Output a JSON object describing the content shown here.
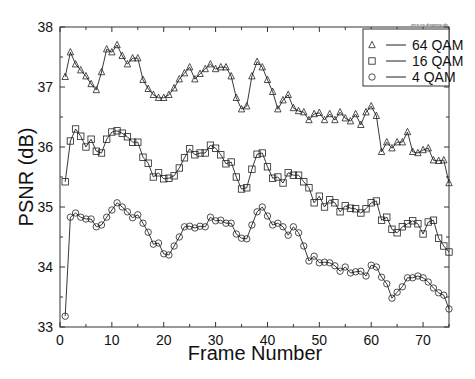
{
  "chart_data": {
    "type": "line",
    "title": "",
    "file_label": "zero-no-dropping.gle",
    "xlabel": "Frame Number",
    "ylabel": "PSNR (dB)",
    "xlim": [
      0,
      75
    ],
    "ylim": [
      33,
      38
    ],
    "xticks": [
      0,
      10,
      20,
      30,
      40,
      50,
      60,
      70
    ],
    "yticks": [
      33,
      34,
      35,
      36,
      37,
      38
    ],
    "grid": false,
    "legend_position": "top-right",
    "x": [
      1,
      2,
      3,
      4,
      5,
      6,
      7,
      8,
      9,
      10,
      11,
      12,
      13,
      14,
      15,
      16,
      17,
      18,
      19,
      20,
      21,
      22,
      23,
      24,
      25,
      26,
      27,
      28,
      29,
      30,
      31,
      32,
      33,
      34,
      35,
      36,
      37,
      38,
      39,
      40,
      41,
      42,
      43,
      44,
      45,
      46,
      47,
      48,
      49,
      50,
      51,
      52,
      53,
      54,
      55,
      56,
      57,
      58,
      59,
      60,
      61,
      62,
      63,
      64,
      65,
      66,
      67,
      68,
      69,
      70,
      71,
      72,
      73,
      74,
      75
    ],
    "series": [
      {
        "name": "64 QAM",
        "marker": "triangle",
        "values": [
          37.17,
          37.58,
          37.38,
          37.28,
          37.18,
          37.05,
          36.95,
          37.25,
          37.63,
          37.58,
          37.7,
          37.52,
          37.38,
          37.48,
          37.48,
          37.12,
          36.97,
          36.87,
          36.82,
          36.82,
          36.87,
          36.98,
          37.13,
          37.23,
          37.33,
          37.13,
          37.22,
          37.3,
          37.38,
          37.3,
          37.33,
          37.33,
          37.18,
          36.82,
          36.63,
          36.68,
          37.18,
          37.42,
          37.33,
          37.12,
          36.92,
          36.63,
          36.78,
          36.87,
          36.65,
          36.6,
          36.58,
          36.45,
          36.55,
          36.57,
          36.45,
          36.55,
          36.45,
          36.58,
          36.48,
          36.43,
          36.55,
          36.37,
          36.58,
          36.68,
          36.52,
          35.92,
          36.08,
          35.98,
          36.08,
          36.08,
          36.25,
          35.92,
          35.9,
          35.95,
          35.98,
          35.78,
          35.77,
          35.78,
          35.4
        ]
      },
      {
        "name": "16 QAM",
        "marker": "square",
        "values": [
          35.42,
          36.1,
          36.3,
          36.18,
          36.0,
          36.13,
          35.93,
          35.9,
          36.13,
          36.25,
          36.27,
          36.23,
          36.17,
          36.08,
          36.08,
          35.83,
          35.73,
          35.5,
          35.57,
          35.47,
          35.48,
          35.52,
          35.65,
          35.82,
          35.97,
          35.87,
          35.9,
          35.9,
          36.03,
          35.98,
          35.87,
          35.72,
          35.75,
          35.5,
          35.3,
          35.32,
          35.63,
          35.88,
          35.9,
          35.67,
          35.48,
          35.5,
          35.4,
          35.57,
          35.53,
          35.53,
          35.42,
          35.32,
          35.07,
          35.18,
          35.0,
          35.12,
          35.07,
          34.92,
          35.02,
          34.98,
          34.97,
          34.9,
          34.97,
          35.07,
          35.1,
          34.78,
          34.83,
          34.63,
          34.57,
          34.67,
          34.72,
          34.77,
          34.72,
          34.55,
          34.75,
          34.78,
          34.48,
          34.35,
          34.25
        ]
      },
      {
        "name": "4 QAM",
        "marker": "circle",
        "values": [
          33.18,
          34.83,
          34.9,
          34.83,
          34.8,
          34.8,
          34.67,
          34.7,
          34.83,
          34.95,
          35.07,
          35.0,
          34.92,
          34.82,
          34.87,
          34.73,
          34.58,
          34.38,
          34.4,
          34.22,
          34.2,
          34.35,
          34.5,
          34.67,
          34.68,
          34.65,
          34.68,
          34.67,
          34.83,
          34.77,
          34.78,
          34.73,
          34.73,
          34.55,
          34.48,
          34.47,
          34.7,
          34.92,
          35.0,
          34.85,
          34.7,
          34.73,
          34.67,
          34.53,
          34.67,
          34.57,
          34.35,
          34.1,
          34.18,
          34.07,
          34.08,
          34.07,
          34.02,
          33.93,
          34.0,
          33.9,
          33.92,
          33.93,
          33.85,
          34.03,
          34.0,
          33.83,
          33.72,
          33.48,
          33.58,
          33.67,
          33.82,
          33.82,
          33.85,
          33.82,
          33.75,
          33.65,
          33.57,
          33.53,
          33.3
        ]
      }
    ]
  },
  "colors": {
    "line": "#222222",
    "axis": "#333333",
    "background": "#ffffff"
  }
}
